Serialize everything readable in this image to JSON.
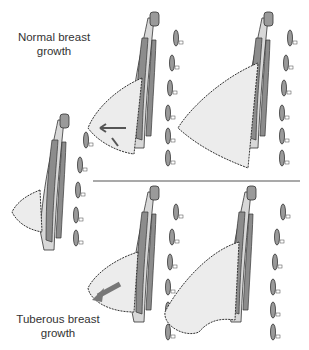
{
  "labels": {
    "normal": "Normal breast growth",
    "tuberous": "Tuberous breast growth"
  },
  "figures": [
    {
      "id": "prepubertal",
      "row": "shared",
      "description": "Flat chest wall with small breast bud"
    },
    {
      "id": "normal-developing",
      "row": "top",
      "description": "Developing breast with arrows showing outward growth"
    },
    {
      "id": "normal-mature",
      "row": "top",
      "description": "Mature conical breast"
    },
    {
      "id": "tuberous-developing",
      "row": "bottom",
      "description": "Constricted base with arrow toward herniating nipple-areola"
    },
    {
      "id": "tuberous-mature",
      "row": "bottom",
      "description": "Tubular breast with herniated areola"
    }
  ],
  "rib_labels": [
    "C1",
    "C2",
    "C3",
    "C4",
    "C5",
    "C6"
  ],
  "colors": {
    "line": "#333333",
    "muscle": "#8c8c8c",
    "gland": "#ececec",
    "divider": "#555555"
  }
}
